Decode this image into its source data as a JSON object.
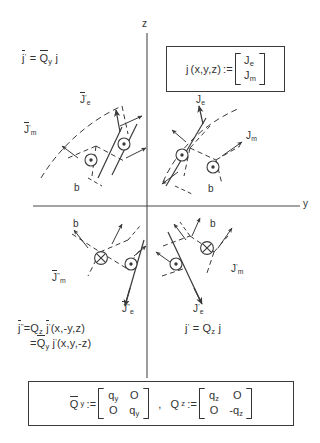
{
  "figure": {
    "kind": "physics-vector-field-symmetry-diagram",
    "axes": {
      "vertical_label": "z",
      "horizontal_label": "y",
      "origin_x": 147,
      "origin_y": 206
    }
  },
  "formulas": {
    "top_left": {
      "lhs_base": "j",
      "lhs_overbar": true,
      "lhs_prime": "'",
      "equals": "=",
      "op_base": "Q",
      "op_overbar": true,
      "op_sub": "y",
      "operand": "j"
    },
    "bottom_left_line1": {
      "lhs_base": "j",
      "lhs_overbar": true,
      "lhs_prime": "\"",
      "equals": "=",
      "op_base": "Q",
      "op_sub": "z",
      "operand_base": "j",
      "operand_overbar": true,
      "operand_prime": "'",
      "args": "(x,-y,z)"
    },
    "bottom_left_line2": {
      "equals": "=",
      "op_base": "Q",
      "op_overbar": true,
      "op_sub": "y",
      "operand_base": "j",
      "operand_prime": "'",
      "args": "(x,y,-z)"
    },
    "bottom_right": {
      "lhs_base": "j",
      "lhs_prime": "'",
      "equals": "=",
      "op_base": "Q",
      "op_sub": "z",
      "operand": "j"
    }
  },
  "definition_box": {
    "lhs": "j",
    "args": "(x,y,z)",
    "assign": ":=",
    "vector_rows": [
      "Je",
      "Jm"
    ],
    "vector_row1_base": "J",
    "vector_row1_sub": "e",
    "vector_row2_base": "J",
    "vector_row2_sub": "m"
  },
  "matrix_box": {
    "first": {
      "name_base": "Q",
      "name_overbar": true,
      "name_sub": "y",
      "assign": ":=",
      "rows": [
        [
          "qy",
          "O"
        ],
        [
          "O",
          "qy"
        ]
      ],
      "cells": [
        [
          {
            "base": "q",
            "sub": "y",
            "neg": false
          },
          {
            "base": "O",
            "sub": "",
            "neg": false
          }
        ],
        [
          {
            "base": "O",
            "sub": "",
            "neg": false
          },
          {
            "base": "q",
            "sub": "y",
            "neg": false
          }
        ]
      ]
    },
    "separator": ",",
    "second": {
      "name_base": "Q",
      "name_overbar": false,
      "name_sub": "z",
      "assign": ":=",
      "rows": [
        [
          "qz",
          "O"
        ],
        [
          "O",
          "-qz"
        ]
      ],
      "cells": [
        [
          {
            "base": "q",
            "sub": "z",
            "neg": false
          },
          {
            "base": "O",
            "sub": "",
            "neg": false
          }
        ],
        [
          {
            "base": "O",
            "sub": "",
            "neg": false
          },
          {
            "base": "q",
            "sub": "z",
            "neg": true
          }
        ]
      ]
    }
  },
  "quadrants": {
    "upper_left": {
      "name": "quadrant-II",
      "labels": {
        "electric": {
          "base": "J",
          "overbar": true,
          "prime": "'",
          "sub": "e"
        },
        "magnetic": {
          "base": "J",
          "overbar": true,
          "prime": "'",
          "sub": "m"
        },
        "b": "b"
      },
      "markers": [
        "dot-out",
        "dot-out"
      ]
    },
    "upper_right": {
      "name": "quadrant-I",
      "labels": {
        "electric": {
          "base": "J",
          "overbar": false,
          "prime": "",
          "sub": "e"
        },
        "magnetic": {
          "base": "J",
          "overbar": false,
          "prime": "",
          "sub": "m"
        },
        "b": "b"
      },
      "markers": [
        "dot-out",
        "dot-out"
      ]
    },
    "lower_left": {
      "name": "quadrant-III",
      "labels": {
        "electric": {
          "base": "J",
          "overbar": true,
          "prime": "\"",
          "sub": "e"
        },
        "magnetic": {
          "base": "J",
          "overbar": true,
          "prime": "\"",
          "sub": "m"
        },
        "b": "b"
      },
      "markers": [
        "cross-in",
        "dot-out"
      ]
    },
    "lower_right": {
      "name": "quadrant-IV",
      "labels": {
        "electric": {
          "base": "J",
          "overbar": false,
          "prime": "'",
          "sub": "e"
        },
        "magnetic": {
          "base": "J",
          "overbar": false,
          "prime": "'",
          "sub": "m"
        },
        "b": "b"
      },
      "markers": [
        "cross-in",
        "dot-out"
      ]
    }
  },
  "colors": {
    "ink": "#333333",
    "axis": "#4a4a4a",
    "paper": "#ffffff"
  }
}
